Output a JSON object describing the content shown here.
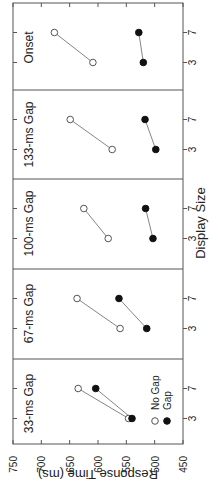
{
  "chart_data": {
    "type": "line",
    "orientation": "rotated -90deg (figure shown sideways)",
    "ylabel": "Response Time (ms)",
    "xlabel": "Display Size",
    "ylim": [
      450,
      750
    ],
    "yticks": [
      750,
      700,
      650,
      600,
      550,
      500,
      450
    ],
    "categories": [
      "3",
      "7"
    ],
    "legend": [
      {
        "name": "No Gap",
        "marker": "open-circle"
      },
      {
        "name": "Gap",
        "marker": "filled-circle"
      }
    ],
    "panels": [
      {
        "title": "33-ms Gap",
        "series": [
          {
            "name": "No Gap",
            "values": [
              546,
              635
            ]
          },
          {
            "name": "Gap",
            "values": [
              540,
              604
            ]
          }
        ]
      },
      {
        "title": "67-ms Gap",
        "series": [
          {
            "name": "No Gap",
            "values": [
              561,
              637
            ]
          },
          {
            "name": "Gap",
            "values": [
              514,
              563
            ]
          }
        ]
      },
      {
        "title": "100-ms Gap",
        "series": [
          {
            "name": "No Gap",
            "values": [
              582,
              625
            ]
          },
          {
            "name": "Gap",
            "values": [
              503,
              516
            ]
          }
        ]
      },
      {
        "title": "133-ms Gap",
        "series": [
          {
            "name": "No Gap",
            "values": [
              575,
              649
            ]
          },
          {
            "name": "Gap",
            "values": [
              498,
              517
            ]
          }
        ]
      },
      {
        "title": "Onset",
        "series": [
          {
            "name": "No Gap",
            "values": [
              609,
              677
            ]
          },
          {
            "name": "Gap",
            "values": [
              520,
              528
            ]
          }
        ]
      }
    ]
  },
  "labels": {
    "ylabel": "Response Time (ms)",
    "xlabel": "Display Size",
    "legend_no_gap": "No Gap",
    "legend_gap": "Gap",
    "panel_titles": [
      "33-ms Gap",
      "67-ms Gap",
      "100-ms Gap",
      "133-ms Gap",
      "Onset"
    ],
    "yticks": [
      "750",
      "700",
      "650",
      "600",
      "550",
      "500",
      "450"
    ],
    "size_small": "3",
    "size_large": "7"
  }
}
